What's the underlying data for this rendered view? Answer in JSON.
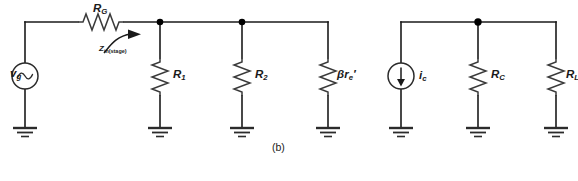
{
  "figure": {
    "caption": "(b)"
  },
  "labels": {
    "source_voltage": "v",
    "source_voltage_sub": "g",
    "series_resistor": "R",
    "series_resistor_sub": "G",
    "zin": "Z",
    "zin_sub": "in(stage)",
    "r1": "R",
    "r1_sub": "1",
    "r2": "R",
    "r2_sub": "2",
    "beta": "β",
    "beta_r": "r",
    "beta_r_sub": "e",
    "beta_r_prime": "′",
    "current_source": "i",
    "current_source_sub": "c",
    "rc": "R",
    "rc_sub": "C",
    "rl": "R",
    "rl_sub": "L"
  },
  "components": {
    "voltage_source": {
      "name": "ac-voltage-source",
      "symbol": "sine-wave",
      "x": 25,
      "y": 76
    },
    "current_source": {
      "name": "ac-current-source",
      "symbol": "down-arrow",
      "x": 401,
      "y": 76
    },
    "resistors": [
      {
        "name": "RG",
        "orientation": "horizontal",
        "x": 100,
        "y": 22
      },
      {
        "name": "R1",
        "orientation": "vertical",
        "x": 160,
        "y": 75
      },
      {
        "name": "R2",
        "orientation": "vertical",
        "x": 242,
        "y": 75
      },
      {
        "name": "beta-re",
        "orientation": "vertical",
        "x": 328,
        "y": 75
      },
      {
        "name": "RC",
        "orientation": "vertical",
        "x": 478,
        "y": 75
      },
      {
        "name": "RL",
        "orientation": "vertical",
        "x": 556,
        "y": 75
      }
    ],
    "nodes": [
      {
        "name": "node-r1",
        "x": 160,
        "y": 22
      },
      {
        "name": "node-r2",
        "x": 242,
        "y": 22
      },
      {
        "name": "node-rc",
        "x": 478,
        "y": 22
      }
    ],
    "grounds": [
      {
        "name": "ground-source",
        "x": 25
      },
      {
        "name": "ground-r1",
        "x": 160
      },
      {
        "name": "ground-r2",
        "x": 242
      },
      {
        "name": "ground-beta-re",
        "x": 328
      },
      {
        "name": "ground-current-source",
        "x": 401
      },
      {
        "name": "ground-rc",
        "x": 478
      },
      {
        "name": "ground-rl",
        "x": 556
      }
    ]
  },
  "colors": {
    "wire": "#1a1a1a",
    "background": "#ffffff",
    "text": "#1a1a1a",
    "resistor": "#3a3a3a"
  }
}
